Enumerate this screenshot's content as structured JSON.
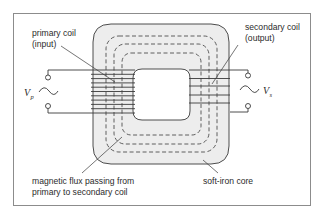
{
  "diagram": {
    "colors": {
      "frame": "#8c8c8c",
      "core_fill": "#ededed",
      "line": "#3a3a3a",
      "text": "#2b2b2b",
      "background": "#ffffff"
    },
    "labels": {
      "primary_coil_line1": "primary coil",
      "primary_coil_line2": "(input)",
      "secondary_coil_line1": "secondary coil",
      "secondary_coil_line2": "(output)",
      "flux_line1": "magnetic flux passing from",
      "flux_line2": "primary to secondary coil",
      "core": "soft-iron core",
      "vp_main": "V",
      "vp_sub": "p",
      "vs_main": "V",
      "vs_sub": "s"
    },
    "components": {
      "primary_coil_turns": 11,
      "secondary_coil_turns": 5,
      "flux_paths": 3,
      "ac_source_symbol": "sine-wave",
      "terminals": [
        "input-top",
        "input-bottom",
        "output-top",
        "output-bottom"
      ]
    }
  }
}
